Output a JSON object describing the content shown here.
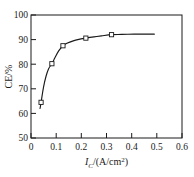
{
  "chart_data": {
    "type": "line",
    "title": "",
    "subtitle": "",
    "xlabel": "I_C/(A/cm^2)",
    "xlabel_parts": {
      "symbol": "I",
      "subscript": "C",
      "units": "/(A/cm",
      "superscript": "2",
      "close": ")"
    },
    "ylabel": "CE/%",
    "xlim": [
      0,
      0.6
    ],
    "ylim": [
      50,
      100
    ],
    "xticks": [
      0,
      0.1,
      0.2,
      0.3,
      0.4,
      0.5,
      0.6
    ],
    "xtick_labels": [
      "0",
      "0.1",
      "0.2",
      "0.3",
      "0.4",
      "0.5",
      "0.6"
    ],
    "yticks": [
      50,
      60,
      70,
      80,
      90,
      100
    ],
    "ytick_labels": [
      "50",
      "60",
      "70",
      "80",
      "90",
      "100"
    ],
    "grid": false,
    "legend": null,
    "tick_direction": "in",
    "frame": "box",
    "series": [
      {
        "name": "CE vs current density",
        "marker": "open-square",
        "marker_color": "#ffffff",
        "marker_edge_color": "#1a1a1a",
        "line_color": "#1a1a1a",
        "x": [
          0.04,
          0.083,
          0.127,
          0.218,
          0.32
        ],
        "y": [
          64.5,
          80.2,
          87.5,
          90.6,
          92.0
        ]
      }
    ],
    "curve": {
      "x": [
        0.036,
        0.04,
        0.05,
        0.06,
        0.07,
        0.083,
        0.095,
        0.11,
        0.127,
        0.145,
        0.165,
        0.19,
        0.218,
        0.25,
        0.28,
        0.32,
        0.36,
        0.41,
        0.45,
        0.49
      ],
      "y": [
        62.0,
        64.5,
        70.8,
        75.2,
        78.2,
        80.2,
        82.6,
        85.4,
        87.5,
        88.6,
        89.4,
        90.1,
        90.6,
        91.1,
        91.5,
        92.0,
        92.1,
        92.2,
        92.2,
        92.2
      ]
    },
    "colors": {
      "axis": "#1a1a1a",
      "line": "#1a1a1a",
      "background": "#ffffff"
    }
  }
}
